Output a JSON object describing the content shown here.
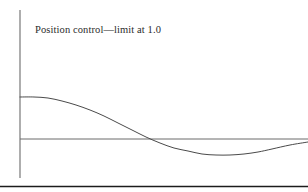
{
  "figure": {
    "caption": "Position control—limit at 1.0",
    "background_color": "#ffffff",
    "axis_color": "#6b6b6b",
    "curve_color": "#4a4a4a",
    "border_color": "#1c1c1c"
  },
  "chart_data": {
    "type": "line",
    "title": "Position control—limit at 1.0",
    "xlabel": "",
    "ylabel": "",
    "grid": false,
    "legend": null,
    "xlim": [
      0,
      10
    ],
    "ylim": [
      -0.5,
      1.2
    ],
    "axes": {
      "y_axis_x_px": 20,
      "y_axis_top_px": 10,
      "y_axis_bottom_px": 178,
      "x_axis_y_px": 139,
      "x_axis_left_px": 20,
      "x_axis_right_px": 308,
      "zero_crossing_x_px": 149
    },
    "series": [
      {
        "name": "position response",
        "x": [
          0.0,
          0.5,
          1.0,
          1.5,
          2.0,
          2.5,
          3.0,
          3.5,
          4.0,
          4.5,
          5.0,
          5.5,
          6.0,
          6.5,
          7.0,
          7.5,
          8.0,
          8.5,
          9.0,
          9.5,
          10.0
        ],
        "y": [
          1.0,
          0.99,
          0.96,
          0.91,
          0.83,
          0.72,
          0.58,
          0.42,
          0.26,
          0.11,
          -0.02,
          -0.13,
          -0.22,
          -0.29,
          -0.34,
          -0.37,
          -0.38,
          -0.36,
          -0.32,
          -0.26,
          -0.19
        ],
        "points_px": [
          [
            20,
            97
          ],
          [
            34,
            97
          ],
          [
            48,
            98
          ],
          [
            62,
            101
          ],
          [
            76,
            105
          ],
          [
            90,
            110
          ],
          [
            104,
            116
          ],
          [
            118,
            123
          ],
          [
            132,
            130
          ],
          [
            146,
            137
          ],
          [
            160,
            143
          ],
          [
            174,
            148
          ],
          [
            188,
            151
          ],
          [
            202,
            154
          ],
          [
            216,
            155
          ],
          [
            230,
            155
          ],
          [
            244,
            154
          ],
          [
            258,
            152
          ],
          [
            272,
            149
          ],
          [
            290,
            145
          ],
          [
            308,
            142
          ]
        ]
      }
    ],
    "annotations": [
      {
        "text": "Position control—limit at 1.0",
        "x_px": 35,
        "y_px": 34
      }
    ]
  }
}
